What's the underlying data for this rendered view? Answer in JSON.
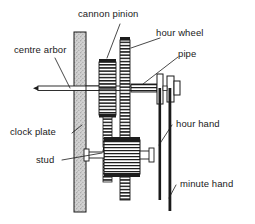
{
  "figure": {
    "background_color": "#ffffff",
    "ink_color": "#1a1a1a",
    "plate_fill_color": "#c9c9c9",
    "gear_fill_color": "#ffffff",
    "hatch_color": "#222222"
  },
  "labels": {
    "cannon_pinion": "cannon pinion",
    "hour_wheel": "hour wheel",
    "pipe": "pipe",
    "centre_arbor": "centre arbor",
    "clock_plate": "clock plate",
    "stud": "stud",
    "hour_hand": "hour hand",
    "minute_hand": "minute hand"
  },
  "parts": [
    {
      "name": "centre arbor",
      "description": "thin horizontal shaft entering from the left with a pointed tip"
    },
    {
      "name": "clock plate",
      "description": "vertical stippled plate running the full height of the drawing"
    },
    {
      "name": "cannon pinion",
      "description": "toothed sleeve riding on the centre arbor just right of the plate"
    },
    {
      "name": "hour wheel",
      "description": "tall narrow toothed wheel to the right of the cannon pinion"
    },
    {
      "name": "pipe",
      "description": "tube on the arbor carrying the hour hand"
    },
    {
      "name": "stud",
      "description": "short pin fixed through the plate carrying the lower gear"
    },
    {
      "name": "hour hand",
      "description": "shorter vertical hand at the right"
    },
    {
      "name": "minute hand",
      "description": "longer vertical hand at the right reaching the bottom"
    }
  ]
}
